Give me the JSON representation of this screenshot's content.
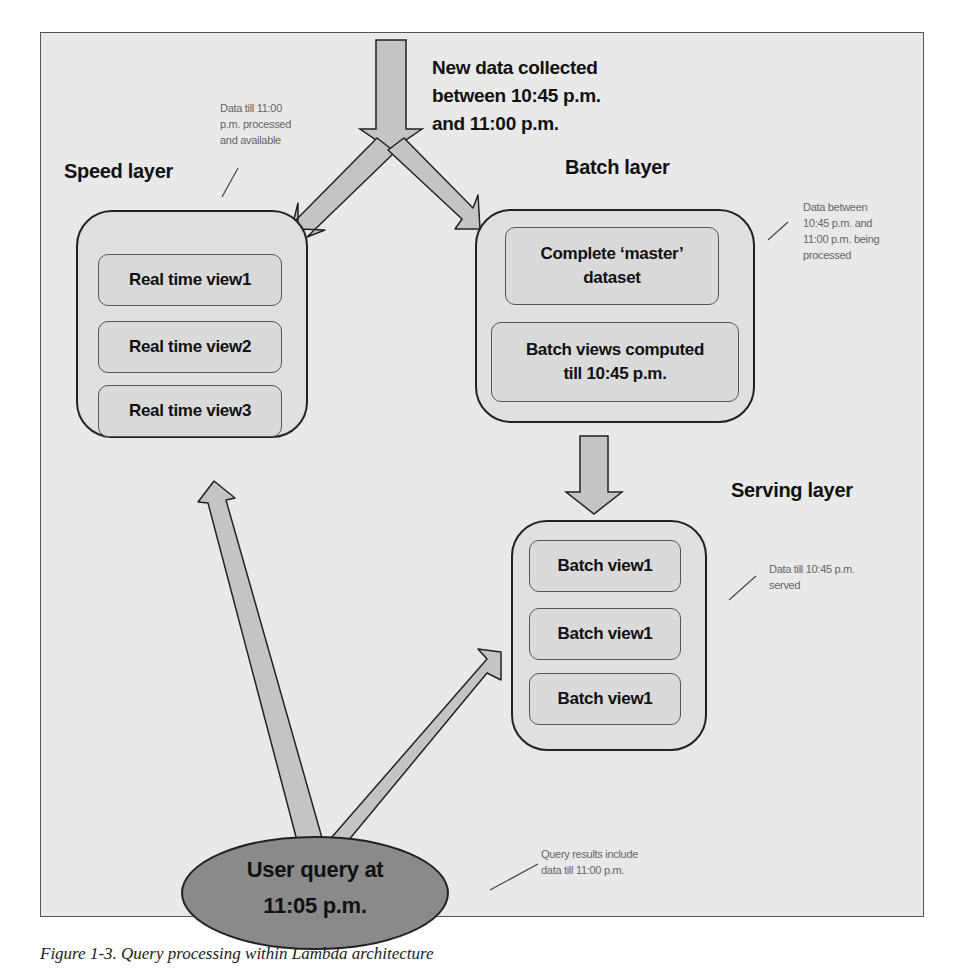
{
  "title_label": "New data collected\nbetween 10:45 p.m.\nand 11:00 p.m.",
  "incoming": {
    "line1": "New data collected",
    "line2": "between 10:45 p.m.",
    "line3": "and 11:00 p.m."
  },
  "speed_layer": {
    "title": "Speed layer",
    "note": [
      "Data till 11:00",
      "p.m. processed",
      "and available"
    ],
    "views": [
      "Real time view1",
      "Real time view2",
      "Real time view3"
    ]
  },
  "batch_layer": {
    "title": "Batch layer",
    "note": [
      "Data between",
      "10:45 p.m. and",
      "11:00 p.m. being",
      "processed"
    ],
    "master_dataset": [
      "Complete ‘master’",
      "dataset"
    ],
    "batch_views": [
      "Batch views computed",
      "till 10:45 p.m."
    ]
  },
  "serving_layer": {
    "title": "Serving layer",
    "note": [
      "Data till 10:45 p.m.",
      "served"
    ],
    "views": [
      "Batch view1",
      "Batch view1",
      "Batch view1"
    ]
  },
  "user_query": {
    "lines": [
      "User query at",
      "11:05 p.m."
    ],
    "note": [
      "Query results include",
      "data till 11:00 p.m."
    ]
  },
  "colors": {
    "background": "#e9e9e9",
    "box_fill": "#dadada",
    "arrow_fill": "#c4c4c4",
    "query_fill": "#8a8a8a",
    "note_text": "#666666"
  },
  "caption": "Figure 1-3. Query processing within Lambda architecture"
}
